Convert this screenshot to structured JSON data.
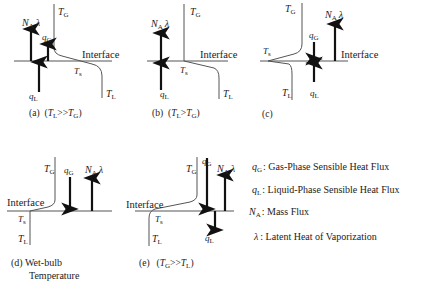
{
  "panels": [
    {
      "id": "a",
      "caption": "(a)",
      "condition": "(T_L>>T_G)",
      "labels": {
        "T_G": "T",
        "T_G_sub": "G",
        "T_L": "T",
        "T_L_sub": "L",
        "T_s": "T",
        "T_s_sub": "s",
        "interface": "Interface",
        "N_A": "N",
        "N_A_sub": "A",
        "lambda": "λ",
        "q_G": "q",
        "q_G_sub": "G",
        "q_L": "q",
        "q_L_sub": "L"
      },
      "arrows": {
        "N_A": "up",
        "q_G": "up",
        "q_L": "up"
      }
    },
    {
      "id": "b",
      "caption": "(b)",
      "condition": "(T_L>T_G)",
      "labels": {
        "T_G": "T",
        "T_G_sub": "G",
        "T_L": "T",
        "T_L_sub": "L",
        "T_s": "T",
        "T_s_sub": "s",
        "interface": "Interface",
        "N_A": "N",
        "N_A_sub": "A",
        "lambda": "λ",
        "q_L": "q",
        "q_L_sub": "L"
      },
      "arrows": {
        "N_A": "up",
        "q_L": "up"
      }
    },
    {
      "id": "c",
      "caption": "(c)",
      "condition": "",
      "labels": {
        "T_G": "T",
        "T_G_sub": "G",
        "T_L": "T",
        "T_L_sub": "L",
        "T_s": "T",
        "T_s_sub": "s",
        "interface": "Interface",
        "N_A": "N",
        "N_A_sub": "A",
        "lambda": "λ",
        "q_G": "q",
        "q_G_sub": "G",
        "q_L": "q",
        "q_L_sub": "L"
      },
      "arrows": {
        "N_A": "up",
        "q_G": "down",
        "q_L": "up"
      }
    },
    {
      "id": "d",
      "caption": "(d) Wet-bulb",
      "caption_line2": "Temperature",
      "labels": {
        "T_G": "T",
        "T_G_sub": "G",
        "T_L": "T",
        "T_L_sub": "L",
        "T_s": "T",
        "T_s_sub": "s",
        "interface": "Interface",
        "N_A": "N",
        "N_A_sub": "A",
        "lambda": "λ",
        "q_G": "q",
        "q_G_sub": "G"
      },
      "arrows": {
        "N_A": "up",
        "q_G": "down"
      }
    },
    {
      "id": "e",
      "caption": "(e)",
      "condition": "(T_G>>T_L)",
      "labels": {
        "T_G": "T",
        "T_G_sub": "G",
        "T_L": "T",
        "T_L_sub": "L",
        "T_s": "T",
        "T_s_sub": "s",
        "interface": "Interface",
        "N_A": "N",
        "N_A_sub": "A",
        "lambda": "λ",
        "q_G": "q",
        "q_G_sub": "G",
        "q_L": "q",
        "q_L_sub": "L"
      },
      "arrows": {
        "N_A": "up",
        "q_G": "down",
        "q_L": "down"
      }
    }
  ],
  "legend": [
    {
      "symbol": "q",
      "sub": "G",
      "text": ": Gas-Phase Sensible Heat Flux"
    },
    {
      "symbol": "q",
      "sub": "L",
      "text": ": Liquid-Phase Sensible Heat Flux"
    },
    {
      "symbol": "N",
      "sub": "A",
      "text": ": Mass Flux"
    },
    {
      "symbol": "λ",
      "sub": "",
      "text": ": Latent Heat of Vaporization"
    }
  ],
  "captions": {
    "a_cond_1": "(",
    "a_cond_T1": "T",
    "a_cond_s1": "L",
    "a_cond_op": ">>",
    "a_cond_T2": "T",
    "a_cond_s2": "G",
    "a_cond_2": ")",
    "b_cond_op": ">",
    "e_cond_s1": "G",
    "e_cond_s2": "L"
  }
}
